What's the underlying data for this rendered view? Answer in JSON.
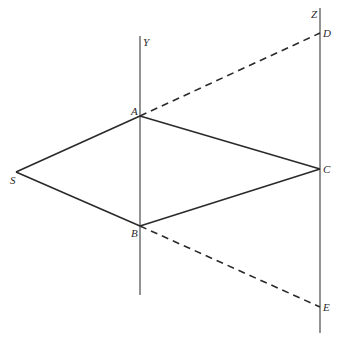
{
  "diagram": {
    "points": {
      "S": {
        "label": "S",
        "x": 16,
        "y": 172
      },
      "A": {
        "label": "A",
        "x": 140,
        "y": 116
      },
      "B": {
        "label": "B",
        "x": 140,
        "y": 226
      },
      "C": {
        "label": "C",
        "x": 320,
        "y": 169
      },
      "D": {
        "label": "D",
        "x": 320,
        "y": 33
      },
      "E": {
        "label": "E",
        "x": 320,
        "y": 307
      }
    },
    "axes": {
      "Y": {
        "label": "Y",
        "x": 140,
        "y1": 36,
        "y2": 295
      },
      "Z": {
        "label": "Z",
        "x": 320,
        "y1": 8,
        "y2": 333
      }
    },
    "solid_segments": [
      "S-A",
      "S-B",
      "A-C",
      "B-C"
    ],
    "dashed_segments": [
      "A-D",
      "B-E"
    ],
    "colors": {
      "ink": "#2a2a2a",
      "background": "#ffffff"
    }
  }
}
